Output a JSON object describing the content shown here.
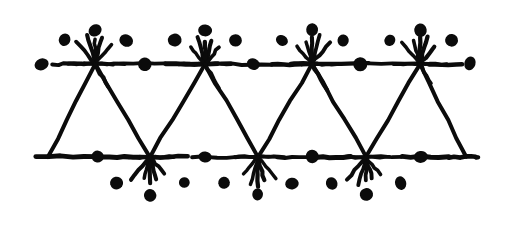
{
  "figure": {
    "medium": "black ink on white ground",
    "width": 511,
    "height": 230,
    "background_color": "#ffffff",
    "ink_color": "#0b0b0b"
  },
  "geometry": {
    "top_rail_y": 64,
    "bottom_rail_y": 157,
    "top_rail_x_start": 52,
    "top_rail_x_end": 462,
    "bottom_rail_x_start": 36,
    "bottom_rail_x_end": 478,
    "top_node_x": [
      95,
      205,
      312,
      420
    ],
    "bottom_node_x": [
      150,
      258,
      366
    ],
    "left_leg_top_x": 95,
    "left_leg_bottom_x": 48,
    "right_leg_top_x": 420,
    "right_leg_bottom_x": 466
  },
  "stars": {
    "top_ray_count": 8,
    "bottom_ray_count": 7,
    "top_ray_angles_deg": [
      0,
      180,
      255,
      285,
      270,
      230,
      310,
      60
    ],
    "bottom_ray_angles_deg": [
      0,
      180,
      75,
      105,
      90,
      50,
      130
    ],
    "ray_length": 26,
    "ray_stroke_width": 3.4
  },
  "dots": {
    "rail_dot_radius": 6.2,
    "halo_dot_radius": 6.0,
    "top_rail_dots_x": [
      42,
      145,
      253,
      360,
      470
    ],
    "bottom_rail_dots_x": [
      97,
      205,
      312,
      421
    ],
    "top_halo_offsets": [
      {
        "dx": -30,
        "dy": -24
      },
      {
        "dx": 0,
        "dy": -34
      },
      {
        "dx": 31,
        "dy": -24
      }
    ],
    "bottom_halo_offsets": [
      {
        "dx": -34,
        "dy": 26
      },
      {
        "dx": 0,
        "dy": 38
      },
      {
        "dx": 34,
        "dy": 26
      }
    ]
  },
  "labels": {
    "figure_label": "",
    "alt_text": "Repeating triangular zigzag ornament with eight-ray stars and dots"
  }
}
